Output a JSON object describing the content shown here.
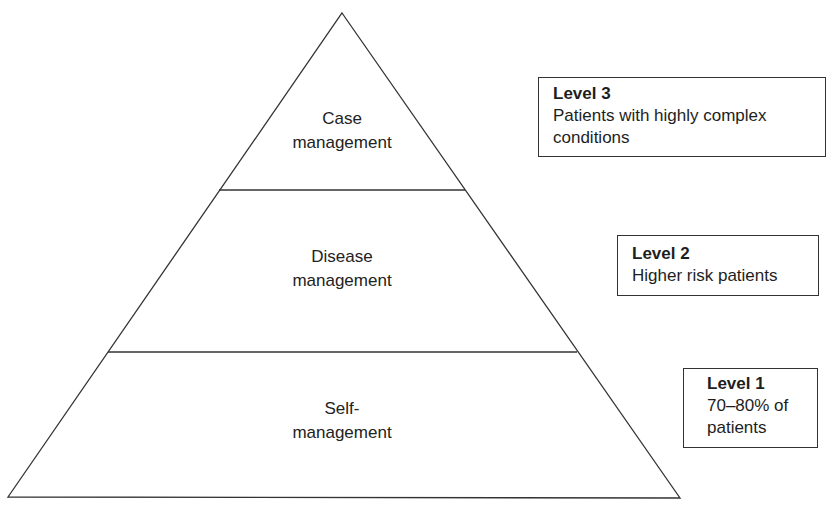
{
  "diagram": {
    "type": "pyramid",
    "tiers": [
      {
        "id": "top",
        "lines": [
          "Case",
          "management"
        ]
      },
      {
        "id": "middle",
        "lines": [
          "Disease",
          "management"
        ]
      },
      {
        "id": "bottom",
        "lines": [
          "Self-",
          "management"
        ]
      }
    ],
    "levels": [
      {
        "title": "Level 3",
        "lines": [
          "Patients with highly complex",
          "conditions"
        ]
      },
      {
        "title": "Level 2",
        "lines": [
          "Higher risk patients"
        ]
      },
      {
        "title": "Level 1",
        "lines": [
          "70–80% of",
          "patients"
        ]
      }
    ],
    "colors": {
      "stroke": "#333333",
      "text": "#1e1e1e",
      "background": "#ffffff"
    }
  }
}
